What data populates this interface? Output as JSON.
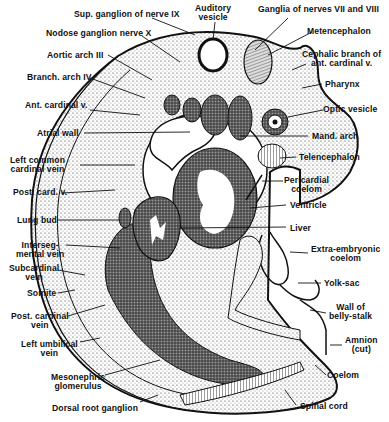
{
  "figure": {
    "ink_color": "#111111",
    "background": "#ffffff"
  },
  "labels": {
    "sup_ganglion": "Sup. ganglion of nerve IX",
    "auditory_vesicle_1": "Auditory",
    "auditory_vesicle_2": "vesicle",
    "ganglia_vii_viii": "Ganglia of nerves VII and VIII",
    "metencephalon": "Metencephalon",
    "nodose_ganglion": "Nodose ganglion nerve X",
    "cephalic_branch_1": "Cephalic branch of",
    "cephalic_branch_2": "ant. cardinal v.",
    "aortic_arch": "Aortic arch III",
    "branch_arch": "Branch. arch IV",
    "pharynx": "Pharynx",
    "ant_cardinal": "Ant. cardinal v.",
    "optic_vesicle": "Optic vesicle",
    "atrial_wall": "Atrial wall",
    "mand_arch": "Mand. arch",
    "left_common_1": "Left common",
    "left_common_2": "cardinal vein",
    "telencephalon": "Telencephalon",
    "pericardial_1": "Pericardial",
    "pericardial_2": "coelom",
    "post_card_v": "Post. card. v.",
    "ventricle": "Ventricle",
    "lung_bud": "Lung bud",
    "liver": "Liver",
    "interseg_1": "Interseg-",
    "interseg_2": "mental vein",
    "extra_1": "Extra-embryonic",
    "extra_2": "coelom",
    "subcardinal_1": "Subcardinal",
    "subcardinal_2": "vein",
    "yolk_sac": "Yolk-sac",
    "somite": "Somite",
    "wall_belly_1": "Wall of",
    "wall_belly_2": "belly-stalk",
    "post_cardinal_1": "Post. cardinal",
    "post_cardinal_2": "vein",
    "amnion_1": "Amnion",
    "amnion_2": "(cut)",
    "left_umbilical_1": "Left umbilical",
    "left_umbilical_2": "vein",
    "coelom": "Coelom",
    "mesonephric_1": "Mesonephric",
    "mesonephric_2": "glomerulus",
    "spinal_cord": "Spinal cord",
    "dorsal_root": "Dorsal root ganglion"
  }
}
